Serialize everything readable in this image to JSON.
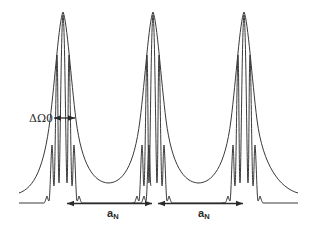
{
  "figure": {
    "colors": {
      "line": "#3a3a3a",
      "background": "#ffffff"
    },
    "envelope_peak_count": 3,
    "comb_lines_per_group": 5,
    "labels": {
      "linewidth": {
        "main": "ΔΩ",
        "sub": "0"
      },
      "period_1": {
        "main": "a",
        "sub": "N"
      },
      "period_2": {
        "main": "a",
        "sub": "N"
      }
    }
  }
}
